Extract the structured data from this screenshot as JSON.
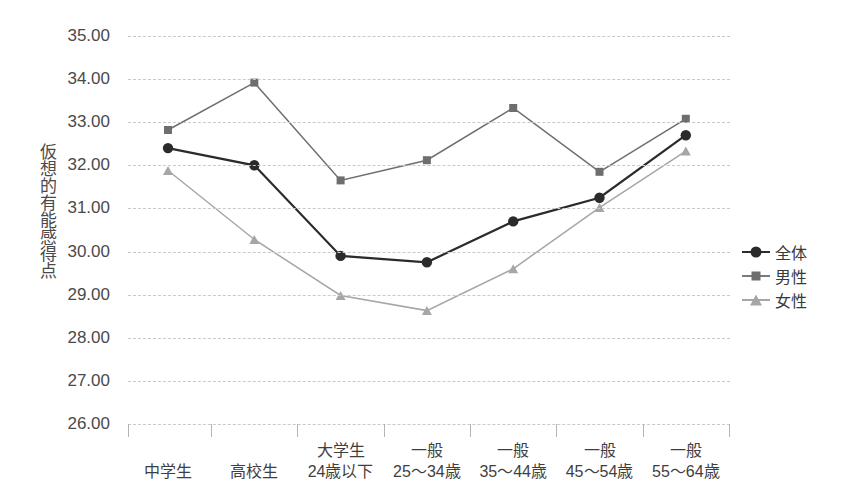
{
  "chart_data": {
    "type": "line",
    "title": "",
    "xlabel": "",
    "ylabel": "仮想的有能感得点",
    "ylim": [
      26.0,
      35.0
    ],
    "ytick_step": 1.0,
    "ytick_labels": [
      "35.00",
      "34.00",
      "33.00",
      "32.00",
      "31.00",
      "30.00",
      "29.00",
      "28.00",
      "27.00",
      "26.00"
    ],
    "ytick_values": [
      35.0,
      34.0,
      33.0,
      32.0,
      31.0,
      30.0,
      29.0,
      28.0,
      27.0,
      26.0
    ],
    "grid": true,
    "legend_position": "right",
    "categories": [
      {
        "line1": "中学生",
        "line2": ""
      },
      {
        "line1": "高校生",
        "line2": ""
      },
      {
        "line1": "大学生",
        "line2": "24歳以下"
      },
      {
        "line1": "一般",
        "line2": "25〜34歳"
      },
      {
        "line1": "一般",
        "line2": "35〜44歳"
      },
      {
        "line1": "一般",
        "line2": "45〜54歳"
      },
      {
        "line1": "一般",
        "line2": "55〜64歳"
      }
    ],
    "series": [
      {
        "name": "全体",
        "marker": "circle",
        "color": "#2b2b2b",
        "values": [
          32.4,
          32.0,
          29.9,
          29.75,
          30.7,
          31.25,
          32.7
        ]
      },
      {
        "name": "男性",
        "marker": "square",
        "color": "#6e6e6e",
        "values": [
          32.82,
          33.92,
          31.65,
          32.12,
          33.33,
          31.85,
          33.08
        ]
      },
      {
        "name": "女性",
        "marker": "triangle",
        "color": "#a6a6a6",
        "values": [
          31.88,
          30.28,
          28.98,
          28.63,
          29.6,
          31.02,
          32.33
        ]
      }
    ]
  },
  "colors": {
    "background": "#ffffff",
    "grid": "#c9c9c9",
    "text": "#3a3a3a",
    "series_zentai": "#2b2b2b",
    "series_dansei": "#6e6e6e",
    "series_josei": "#a6a6a6"
  },
  "legend": {
    "items": [
      {
        "label": "全体"
      },
      {
        "label": "男性"
      },
      {
        "label": "女性"
      }
    ]
  }
}
